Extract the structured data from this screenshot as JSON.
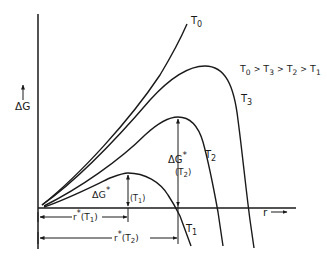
{
  "axes": {
    "y_label": "ΔG",
    "x_label": "r"
  },
  "curves": [
    {
      "id": "T0",
      "label": "T",
      "sub": "0"
    },
    {
      "id": "T3",
      "label": "T",
      "sub": "3"
    },
    {
      "id": "T2",
      "label": "T",
      "sub": "2"
    },
    {
      "id": "T1",
      "label": "T",
      "sub": "1"
    }
  ],
  "ordering": {
    "text": "T0 > T3 > T2 > T1",
    "parts": [
      {
        "t": "T",
        "s": "0"
      },
      {
        "t": "T",
        "s": "3"
      },
      {
        "t": "T",
        "s": "2"
      },
      {
        "t": "T",
        "s": "1"
      }
    ],
    "sep": ">"
  },
  "annotations": {
    "dg_t2": {
      "main": "ΔG",
      "star": "*",
      "sub": "(T",
      "subnum": "2",
      "close": ")"
    },
    "dg_t1": {
      "main": "ΔG",
      "star": "*",
      "sub": "(T",
      "subnum": "1",
      "close": ")"
    },
    "r_t1": {
      "main": "r",
      "star": "*",
      "sub": "(T",
      "subnum": "1",
      "close": ")"
    },
    "r_t2": {
      "main": "r",
      "star": "*",
      "sub": "(T",
      "subnum": "2",
      "close": ")"
    }
  },
  "colors": {
    "ink": "#1a1a1a",
    "background": "#ffffff"
  }
}
